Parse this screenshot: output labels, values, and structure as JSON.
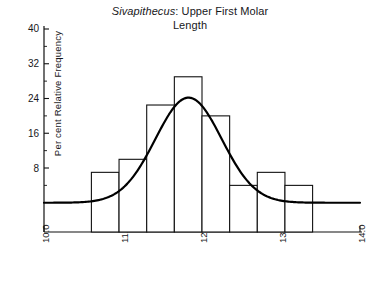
{
  "chart_data": {
    "type": "bar",
    "title": "Sivapithecus: Upper First Molar Length",
    "title_line1_italic": "Sivapithecus",
    "title_line1_rest": ": Upper First Molar",
    "title_line2": "Length",
    "xlabel": "",
    "ylabel": "Per cent Relative Frequency",
    "xlim": [
      10.0,
      14.0
    ],
    "ylim": [
      0,
      40
    ],
    "grid": false,
    "legend": "none",
    "y_ticks": [
      8,
      16,
      24,
      32,
      40
    ],
    "y_tick_labels": [
      "8",
      "16",
      "24",
      "32",
      "40"
    ],
    "y_minor_ticks": [
      4,
      12,
      20,
      28,
      36
    ],
    "x_ticks": [
      10.0,
      11.0,
      12.0,
      13.0,
      14.0
    ],
    "x_tick_labels": [
      "10.0",
      "11.0",
      "12.0",
      "13.0",
      "14.0"
    ],
    "bin_edges": [
      10.6,
      10.95,
      11.3,
      11.65,
      12.0,
      12.35,
      12.7,
      13.05,
      13.4
    ],
    "categories": [
      "10.6-10.95",
      "10.95-11.3",
      "11.3-11.65",
      "11.65-12.0",
      "12.0-12.35",
      "12.35-12.7",
      "12.7-13.05",
      "13.05-13.4"
    ],
    "values": [
      7,
      10,
      22.5,
      29,
      20,
      4,
      7,
      4
    ],
    "overlay_curve": {
      "name": "normal curve",
      "mean": 11.83,
      "sigma": 0.42,
      "peak": 24.2
    }
  }
}
